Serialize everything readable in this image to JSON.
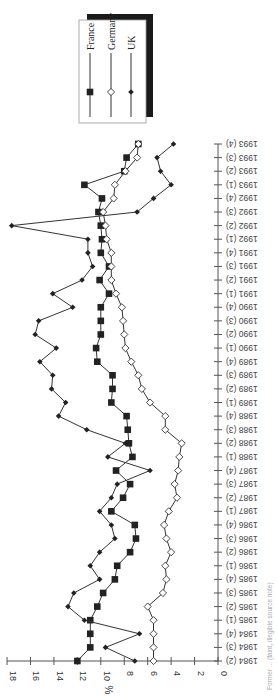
{
  "chart_data": {
    "type": "line",
    "orientation": "rotated-90-clockwise",
    "title": "",
    "xlabel": "",
    "ylabel": "%",
    "ylim": [
      0,
      18
    ],
    "yticks": [
      0,
      2,
      4,
      6,
      8,
      10,
      12,
      14,
      16,
      18
    ],
    "grid": false,
    "legend_position": "top-left (boxed with drop shadow)",
    "categories": [
      "1984 (2)",
      "1984 (3)",
      "1984 (4)",
      "1985 (1)",
      "1985 (2)",
      "1985 (3)",
      "1985 (4)",
      "1986 (1)",
      "1986 (2)",
      "1986 (3)",
      "1986 (4)",
      "1987 (1)",
      "1987 (2)",
      "1987 (3)",
      "1987 (4)",
      "1988 (1)",
      "1988 (2)",
      "1988 (3)",
      "1988 (4)",
      "1989 (1)",
      "1989 (2)",
      "1989 (3)",
      "1989 (4)",
      "1990 (1)",
      "1990 (2)",
      "1990 (3)",
      "1990 (4)",
      "1991 (1)",
      "1991 (2)",
      "1991 (3)",
      "1991 (4)",
      "1992 (1)",
      "1992 (2)",
      "1992 (3)",
      "1992 (4)",
      "1993 (1)",
      "1993 (2)",
      "1993 (3)",
      "1993 (4)"
    ],
    "series": [
      {
        "name": "France",
        "marker": "filled-square",
        "color": "#222222",
        "values": [
          12.0,
          10.9,
          10.9,
          10.9,
          10.3,
          9.8,
          8.8,
          8.6,
          7.5,
          7.0,
          7.1,
          9.1,
          8.1,
          7.5,
          8.7,
          7.3,
          7.6,
          7.7,
          7.8,
          9.1,
          9.0,
          9.0,
          10.3,
          10.4,
          10.0,
          10.0,
          10.0,
          9.3,
          10.1,
          9.3,
          10.0,
          9.9,
          10.0,
          10.2,
          9.9,
          11.4,
          8.0,
          7.8,
          6.8
        ]
      },
      {
        "name": "Germany",
        "marker": "open-diamond",
        "color": "#222222",
        "values": [
          5.5,
          5.5,
          5.5,
          5.5,
          6.0,
          4.7,
          4.4,
          4.5,
          4.0,
          4.4,
          4.6,
          4.2,
          3.5,
          3.7,
          3.4,
          3.3,
          3.1,
          4.5,
          4.5,
          5.8,
          6.5,
          6.8,
          7.4,
          7.9,
          8.0,
          8.1,
          8.2,
          8.7,
          9.1,
          9.1,
          9.1,
          9.5,
          9.6,
          9.8,
          8.9,
          8.8,
          7.9,
          6.9,
          6.8
        ]
      },
      {
        "name": "UK",
        "marker": "filled-diamond",
        "color": "#222222",
        "values": [
          7.1,
          9.6,
          6.7,
          11.4,
          12.8,
          12.3,
          10.1,
          10.9,
          10.1,
          8.8,
          9.1,
          10.1,
          9.1,
          8.6,
          5.8,
          9.4,
          7.9,
          11.2,
          13.6,
          13.0,
          14.2,
          14.1,
          15.2,
          13.8,
          15.6,
          15.3,
          12.4,
          14.1,
          11.6,
          10.7,
          11.1,
          11.1,
          17.6,
          6.9,
          5.5,
          4.0,
          4.9,
          5.2,
          3.8
        ]
      }
    ]
  },
  "axis": {
    "y_unit_label": "%",
    "y_tick_labels": [
      "0",
      "2",
      "4",
      "6",
      "8",
      "10",
      "12",
      "14",
      "16",
      "18"
    ]
  },
  "legend": {
    "items": [
      {
        "label": "France"
      },
      {
        "label": "Germany"
      },
      {
        "label": "UK"
      }
    ]
  },
  "footnote": "Former ... (faint, illegible source note)"
}
